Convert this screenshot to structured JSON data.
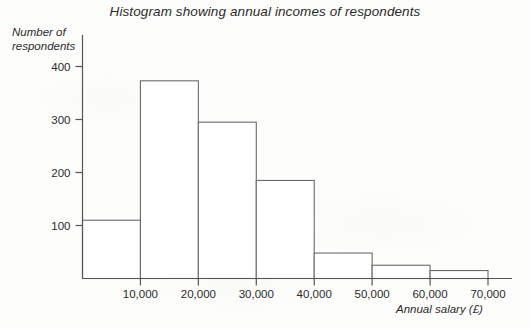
{
  "chart_data": {
    "type": "bar",
    "title": "Histogram showing annual incomes of respondents",
    "xlabel": "Annual salary (£)",
    "ylabel": "Number of\nrespondents",
    "categories": [
      "0–10,000",
      "10,000–20,000",
      "20,000–30,000",
      "30,000–40,000",
      "40,000–50,000",
      "50,000–60,000",
      "60,000–70,000"
    ],
    "bin_edges": [
      0,
      10000,
      20000,
      30000,
      40000,
      50000,
      60000,
      70000
    ],
    "values": [
      110,
      373,
      295,
      185,
      48,
      25,
      15
    ],
    "xlim": [
      0,
      70000
    ],
    "ylim": [
      0,
      440
    ],
    "x_ticks": [
      10000,
      20000,
      30000,
      40000,
      50000,
      60000,
      70000
    ],
    "x_tick_labels": [
      "10,000",
      "20,000",
      "30,000",
      "40,000",
      "50,000",
      "60,000",
      "70,000"
    ],
    "y_ticks": [
      100,
      200,
      300,
      400
    ],
    "y_tick_labels": [
      "100",
      "200",
      "300",
      "400"
    ],
    "grid": false,
    "legend": "none",
    "bar_fill": "#ffffff",
    "bar_stroke": "#6b6b6b",
    "axis_color": "#555555"
  },
  "page": {
    "background": "#fdfdfc"
  }
}
